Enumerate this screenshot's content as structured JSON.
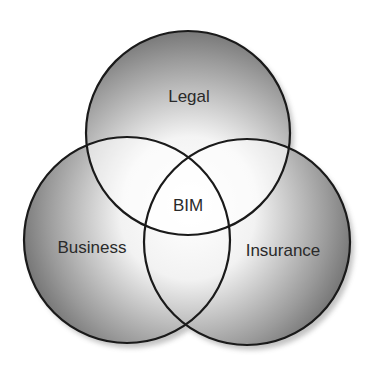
{
  "diagram": {
    "type": "venn",
    "sets": [
      {
        "id": "legal",
        "label": "Legal",
        "position": "top"
      },
      {
        "id": "business",
        "label": "Business",
        "position": "bottom-left"
      },
      {
        "id": "insurance",
        "label": "Insurance",
        "position": "bottom-right"
      }
    ],
    "intersection": {
      "label": "BIM",
      "sets": [
        "legal",
        "business",
        "insurance"
      ]
    }
  },
  "colors": {
    "outline": "#1a1a1a",
    "shade_dark": "#6a6a6a",
    "shade_light": "#ffffff",
    "text": "#2a2a2a"
  }
}
